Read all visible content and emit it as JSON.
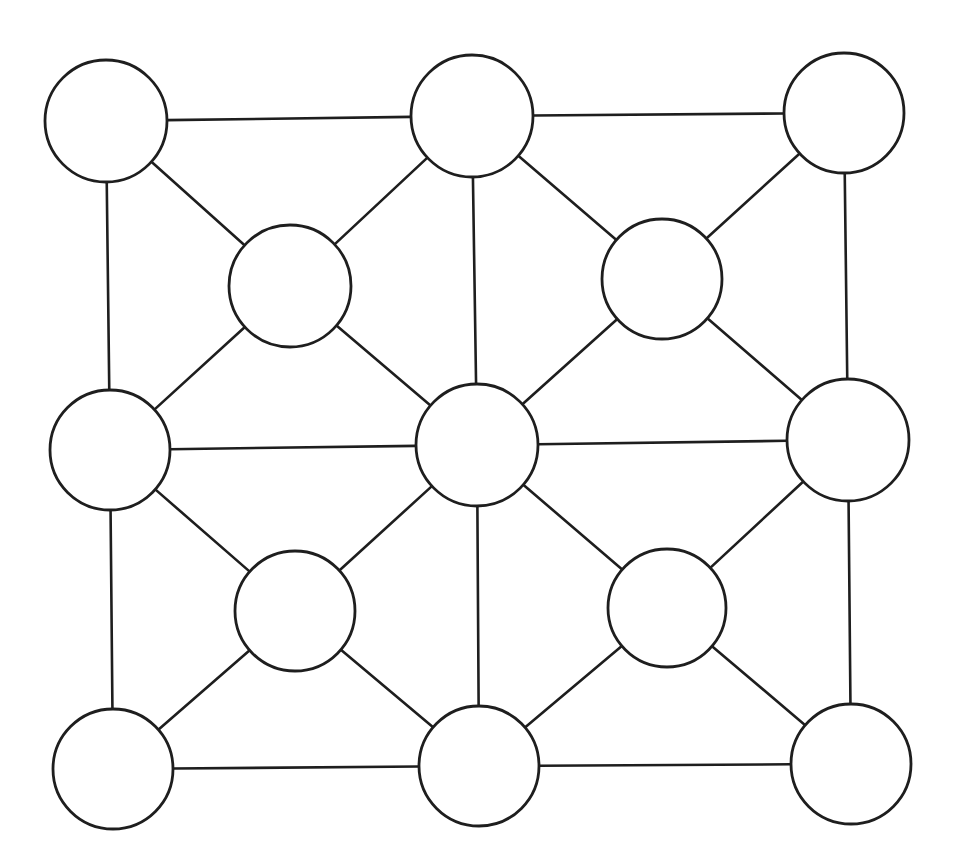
{
  "diagram": {
    "type": "graph",
    "width": 960,
    "height": 865,
    "colors": {
      "background": "#ffffff",
      "stroke": "#1e1e1e",
      "node_fill": "#ffffff"
    },
    "nodes": [
      {
        "id": "TL",
        "cx": 106,
        "cy": 121,
        "r": 61,
        "label": ""
      },
      {
        "id": "TM",
        "cx": 472,
        "cy": 116,
        "r": 61,
        "label": ""
      },
      {
        "id": "TR",
        "cx": 844,
        "cy": 113,
        "r": 60,
        "label": ""
      },
      {
        "id": "UL",
        "cx": 290,
        "cy": 286,
        "r": 61,
        "label": ""
      },
      {
        "id": "UR",
        "cx": 662,
        "cy": 279,
        "r": 60,
        "label": ""
      },
      {
        "id": "ML",
        "cx": 110,
        "cy": 450,
        "r": 60,
        "label": ""
      },
      {
        "id": "MM",
        "cx": 477,
        "cy": 445,
        "r": 61,
        "label": ""
      },
      {
        "id": "MR",
        "cx": 848,
        "cy": 440,
        "r": 61,
        "label": ""
      },
      {
        "id": "LL",
        "cx": 295,
        "cy": 611,
        "r": 60,
        "label": ""
      },
      {
        "id": "LR",
        "cx": 667,
        "cy": 608,
        "r": 59,
        "label": ""
      },
      {
        "id": "BL",
        "cx": 113,
        "cy": 769,
        "r": 60,
        "label": ""
      },
      {
        "id": "BM",
        "cx": 479,
        "cy": 766,
        "r": 60,
        "label": ""
      },
      {
        "id": "BR",
        "cx": 851,
        "cy": 764,
        "r": 60,
        "label": ""
      }
    ],
    "edges": [
      [
        "TL",
        "TM"
      ],
      [
        "TM",
        "TR"
      ],
      [
        "ML",
        "MM"
      ],
      [
        "MM",
        "MR"
      ],
      [
        "BL",
        "BM"
      ],
      [
        "BM",
        "BR"
      ],
      [
        "TL",
        "ML"
      ],
      [
        "ML",
        "BL"
      ],
      [
        "TM",
        "MM"
      ],
      [
        "MM",
        "BM"
      ],
      [
        "TR",
        "MR"
      ],
      [
        "MR",
        "BR"
      ],
      [
        "UL",
        "TL"
      ],
      [
        "UL",
        "TM"
      ],
      [
        "UL",
        "ML"
      ],
      [
        "UL",
        "MM"
      ],
      [
        "UR",
        "TM"
      ],
      [
        "UR",
        "TR"
      ],
      [
        "UR",
        "MM"
      ],
      [
        "UR",
        "MR"
      ],
      [
        "LL",
        "ML"
      ],
      [
        "LL",
        "MM"
      ],
      [
        "LL",
        "BL"
      ],
      [
        "LL",
        "BM"
      ],
      [
        "LR",
        "MM"
      ],
      [
        "LR",
        "MR"
      ],
      [
        "LR",
        "BM"
      ],
      [
        "LR",
        "BR"
      ]
    ]
  }
}
